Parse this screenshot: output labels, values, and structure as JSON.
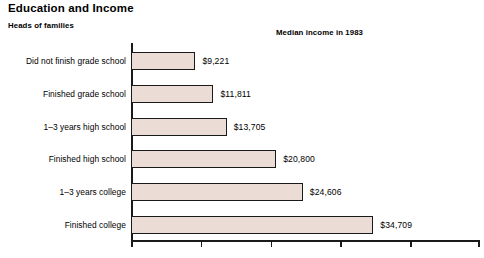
{
  "title": "Education and Income",
  "subtitle_left": "Heads of families",
  "subtitle_right": "Median income in 1983",
  "colors": {
    "bar_fill": "#ecdcd6",
    "bar_outline": "#1a1a1a",
    "axis": "#1a1a1a",
    "background": "#ffffff",
    "text": "#000000"
  },
  "chart_data": {
    "type": "bar",
    "orientation": "horizontal",
    "title": "Education and Income",
    "subtitle": "Heads of families",
    "xlabel": "Median income in 1983",
    "ylabel": "",
    "grid": false,
    "legend": null,
    "xlim": [
      0,
      49700
    ],
    "xticks": [
      0,
      10000,
      20000,
      30000,
      40000,
      49700
    ],
    "xtick_labels": [
      "",
      "",
      "",
      "",
      "",
      ""
    ],
    "categories": [
      "Did not finish grade school",
      "Finished grade school",
      "1–3 years high school",
      "Finished high school",
      "1–3 years college",
      "Finished college"
    ],
    "values": [
      9221,
      11811,
      13705,
      20800,
      24606,
      34709
    ],
    "value_labels": [
      "$9,221",
      "$11,811",
      "$13,705",
      "$20,800",
      "$24,606",
      "$34,709"
    ]
  }
}
